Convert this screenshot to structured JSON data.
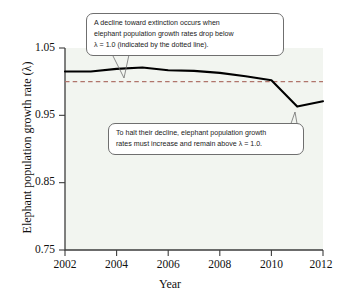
{
  "figure": {
    "background_color": "#ffffff",
    "plot_background_color": "#f2f5f0",
    "axis_color": "#3d3d3d",
    "data_line_color": "#000000",
    "threshold_line_color": "#b0756b",
    "callout_border_color": "#6f6f6f"
  },
  "axes": {
    "x_title": "Year",
    "y_title": "Elephant population growth rate (λ)",
    "x_ticks": [
      "2002",
      "2004",
      "2006",
      "2008",
      "2010",
      "2012"
    ],
    "y_ticks": [
      "1.05",
      "0.95",
      "0.85",
      "0.75"
    ]
  },
  "callouts": {
    "decline": {
      "line1": "A decline toward extinction occurs when",
      "line2": "elephant population growth rates drop below",
      "line3": "λ = 1.0 (indicated by the dotted line)."
    },
    "halt": {
      "line1": "To halt their decline, elephant population growth",
      "line2": "rates must increase and remain above λ = 1.0."
    }
  },
  "chart_data": {
    "type": "line",
    "title": "",
    "xlabel": "Year",
    "ylabel": "Elephant population growth rate (λ)",
    "xlim": [
      2002,
      2012
    ],
    "ylim": [
      0.75,
      1.05
    ],
    "xticks": [
      2002,
      2004,
      2006,
      2008,
      2010,
      2012
    ],
    "yticks": [
      0.75,
      0.85,
      0.95,
      1.05
    ],
    "grid": false,
    "legend": "none",
    "series": [
      {
        "name": "Elephant population growth rate",
        "style": "solid",
        "color": "#000000",
        "x": [
          2002,
          2003,
          2004,
          2005,
          2006,
          2007,
          2008,
          2009,
          2010,
          2011,
          2012
        ],
        "values": [
          1.015,
          1.015,
          1.019,
          1.021,
          1.017,
          1.016,
          1.013,
          1.008,
          1.002,
          0.963,
          0.971
        ]
      }
    ],
    "reference_lines": [
      {
        "name": "lambda-threshold",
        "orientation": "horizontal",
        "value": 1.0,
        "style": "dashed",
        "color": "#b0756b",
        "label": "λ = 1.0"
      }
    ],
    "annotations": [
      {
        "name": "decline-callout",
        "text": "A decline toward extinction occurs when elephant population growth rates drop below λ = 1.0 (indicated by the dotted line).",
        "points_to": "dashed threshold line near 2004"
      },
      {
        "name": "halt-callout",
        "text": "To halt their decline, elephant population growth rates must increase and remain above λ = 1.0.",
        "points_to": "line minimum near 2011"
      }
    ]
  }
}
